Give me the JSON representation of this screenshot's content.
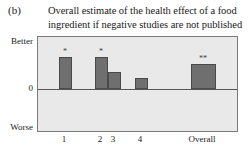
{
  "panel": {
    "label": "(b)"
  },
  "title": {
    "line1": "Overall estimate of the health effect of a food",
    "line2": "ingredient if negative studies are not published"
  },
  "axis": {
    "y_top_label": "Better",
    "y_zero_label": "0",
    "y_bottom_label": "Worse"
  },
  "colors": {
    "bar_fill": "#6f6f6f",
    "bar_stroke": "#4a4a4a",
    "plot_background": "#e9e9e9",
    "plot_border": "#7a7a7a",
    "zero_line": "#585858"
  },
  "chart_data": {
    "type": "bar",
    "title": "Overall estimate of the health effect of a food ingredient if negative studies are not published",
    "xlabel": "",
    "ylabel": "",
    "categories": [
      "1",
      "2",
      "3",
      "4",
      "Overall"
    ],
    "values": [
      0.62,
      0.62,
      0.33,
      0.22,
      0.48
    ],
    "annotations": [
      "*",
      "*",
      "",
      "",
      "**"
    ],
    "ylim": [
      -1,
      1
    ],
    "ytick_labels": [
      "Better",
      "0",
      "Worse"
    ],
    "ytick_values": [
      0.9,
      0,
      -0.75
    ],
    "grid": false,
    "legend": null
  }
}
